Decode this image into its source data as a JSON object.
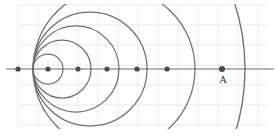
{
  "figure": {
    "width": 277,
    "height": 138,
    "background_color": "#ffffff",
    "curve_color": "#6f6f6f",
    "axis_color": "#6b6b6b",
    "grid_color": "#dfe3e8",
    "dot_color": "#4a4a4a"
  },
  "axis": {
    "name": "horizontal-axis",
    "y": 69,
    "x_start": 6,
    "x_end": 274
  },
  "grid": {
    "spacing": 20,
    "x_start": 18,
    "x_end": 268,
    "y_start": 5,
    "y_end": 128,
    "visible": true
  },
  "common_point": {
    "x": 33,
    "y": 69
  },
  "axis_dots": [
    {
      "name": "dot-1",
      "x": 18,
      "y": 69,
      "r": 2.6
    },
    {
      "name": "dot-2",
      "x": 48,
      "y": 69,
      "r": 2.6
    },
    {
      "name": "dot-3",
      "x": 78,
      "y": 69,
      "r": 2.6
    },
    {
      "name": "dot-4",
      "x": 107,
      "y": 69,
      "r": 2.6
    },
    {
      "name": "dot-5",
      "x": 137,
      "y": 69,
      "r": 2.6
    },
    {
      "name": "dot-6",
      "x": 167,
      "y": 69,
      "r": 2.6
    },
    {
      "name": "dot-A",
      "x": 222,
      "y": 69,
      "r": 3.0
    }
  ],
  "circles": [
    {
      "name": "circle-1",
      "cx": 48,
      "cy": 69,
      "r": 15
    },
    {
      "name": "circle-2",
      "cx": 62,
      "cy": 69,
      "r": 29
    },
    {
      "name": "circle-3",
      "cx": 76,
      "cy": 69,
      "r": 43
    },
    {
      "name": "circle-4",
      "cx": 90,
      "cy": 69,
      "r": 57
    },
    {
      "name": "circle-5",
      "cx": 114,
      "cy": 69,
      "r": 81
    }
  ],
  "arcs": [
    {
      "name": "arc-right-large",
      "cx": 30,
      "cy": 69,
      "r": 215,
      "start_angle_deg": -20,
      "end_angle_deg": 20
    }
  ],
  "labels": [
    {
      "name": "label-A",
      "text": "A",
      "x": 219,
      "y": 83
    }
  ]
}
